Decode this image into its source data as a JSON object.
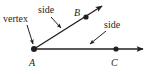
{
  "diagram": {
    "colors": {
      "stroke": "#231f20",
      "background": "#ffffff"
    },
    "labels": {
      "vertex": "vertex",
      "side_top": "side",
      "side_right": "side",
      "point_a": "A",
      "point_b": "B",
      "point_c": "C"
    },
    "points": [
      {
        "name": "A",
        "x": 34,
        "y": 49
      },
      {
        "name": "B",
        "x": 86,
        "y": 17
      },
      {
        "name": "C",
        "x": 116,
        "y": 49
      }
    ],
    "rays": [
      {
        "name": "ray-AB",
        "from": "A",
        "through": "B"
      },
      {
        "name": "ray-AC",
        "from": "A",
        "through": "C"
      }
    ]
  }
}
